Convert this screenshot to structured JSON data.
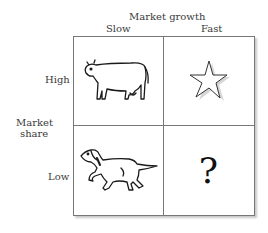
{
  "diagram": {
    "type": "2x2 growth-share matrix",
    "x_axis": {
      "title": "Market growth",
      "columns": [
        "Slow",
        "Fast"
      ]
    },
    "y_axis": {
      "title_line1": "Market",
      "title_line2": "share",
      "rows": [
        "High",
        "Low"
      ]
    },
    "cells": [
      {
        "row": "High",
        "col": "Slow",
        "icon": "cow-icon"
      },
      {
        "row": "High",
        "col": "Fast",
        "icon": "star-icon"
      },
      {
        "row": "Low",
        "col": "Slow",
        "icon": "dog-icon"
      },
      {
        "row": "Low",
        "col": "Fast",
        "icon": "question-mark-icon",
        "symbol": "?"
      }
    ]
  }
}
